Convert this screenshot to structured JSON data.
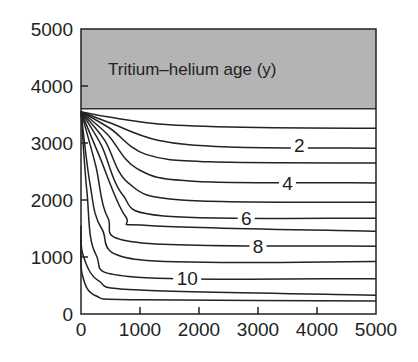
{
  "chart_data": {
    "type": "line",
    "title": "Tritium–helium age (y)",
    "xlabel": "",
    "ylabel": "",
    "xlim": [
      0,
      5000
    ],
    "ylim": [
      0,
      5000
    ],
    "x_ticks": [
      0,
      1000,
      2000,
      3000,
      4000,
      5000
    ],
    "y_ticks": [
      0,
      1000,
      2000,
      3000,
      4000,
      5000
    ],
    "x_tick_labels": [
      "0",
      "1000",
      "2000",
      "3000",
      "4000",
      "5000"
    ],
    "y_tick_labels": [
      "0",
      "1000",
      "2000",
      "3000",
      "4000",
      "5000"
    ],
    "grid": false,
    "shaded_band": {
      "y_from": 3600,
      "y_to": 5000,
      "color": "#b4b4b4",
      "label": "Tritium–helium age (y)"
    },
    "source_point": {
      "x": 0,
      "y": 3550
    },
    "contour_labels": [
      {
        "text": "2",
        "x": 3700,
        "y": 2960
      },
      {
        "text": "4",
        "x": 3500,
        "y": 2300
      },
      {
        "text": "6",
        "x": 2800,
        "y": 1680
      },
      {
        "text": "8",
        "x": 3000,
        "y": 1190
      },
      {
        "text": "10",
        "x": 1800,
        "y": 640
      }
    ],
    "series": [
      {
        "name": "1 y",
        "x": [
          0,
          500,
          1500,
          3000,
          5000
        ],
        "y": [
          3550,
          3450,
          3320,
          3270,
          3260
        ]
      },
      {
        "name": "2 y",
        "x": [
          0,
          500,
          1300,
          2500,
          5000
        ],
        "y": [
          3550,
          3350,
          3050,
          2930,
          2910
        ]
      },
      {
        "name": "3 y",
        "x": [
          0,
          500,
          1100,
          2200,
          5000
        ],
        "y": [
          3550,
          3250,
          2800,
          2670,
          2650
        ]
      },
      {
        "name": "4 y",
        "x": [
          0,
          450,
          950,
          1900,
          5000
        ],
        "y": [
          3550,
          3150,
          2550,
          2330,
          2300
        ]
      },
      {
        "name": "5 y",
        "x": [
          0,
          400,
          800,
          1700,
          5000
        ],
        "y": [
          3550,
          3050,
          2300,
          2000,
          1960
        ]
      },
      {
        "name": "6 y",
        "x": [
          0,
          350,
          700,
          1400,
          5000
        ],
        "y": [
          3550,
          2950,
          2100,
          1720,
          1680
        ]
      },
      {
        "name": "7 y",
        "x": [
          0,
          300,
          750,
          1200,
          5000
        ],
        "y": [
          3550,
          2800,
          1720,
          1550,
          1450
        ]
      },
      {
        "name": "8 y",
        "x": [
          0,
          250,
          450,
          1000,
          5000
        ],
        "y": [
          3550,
          2600,
          1700,
          1250,
          1190
        ]
      },
      {
        "name": "9 y",
        "x": [
          0,
          150,
          350,
          1000,
          5000
        ],
        "y": [
          3550,
          2300,
          1500,
          950,
          920
        ]
      },
      {
        "name": "10 y",
        "x": [
          0,
          100,
          250,
          900,
          5000
        ],
        "y": [
          3550,
          2150,
          1050,
          650,
          620
        ]
      },
      {
        "name": "11 y",
        "x": [
          0,
          30,
          300,
          1000,
          5000
        ],
        "y": [
          1550,
          1050,
          580,
          420,
          330
        ]
      },
      {
        "name": "12 y",
        "x": [
          0,
          20,
          250,
          1000,
          5000
        ],
        "y": [
          1300,
          700,
          320,
          250,
          230
        ]
      }
    ],
    "colors": {
      "band": "#b4b4b4",
      "lines": "#222222",
      "frame": "#222222"
    }
  }
}
